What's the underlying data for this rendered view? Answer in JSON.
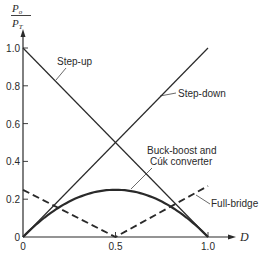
{
  "chart_data": {
    "type": "line",
    "title": "",
    "xlabel": "D",
    "ylabel": "Po/PT",
    "ylabel_parts": {
      "num": "P",
      "num_sub": "o",
      "den": "P",
      "den_sub": "T"
    },
    "xlim": [
      0,
      1.0
    ],
    "ylim": [
      0,
      1.0
    ],
    "grid": false,
    "x_ticks": [
      {
        "value": 0,
        "label": "0"
      },
      {
        "value": 0.5,
        "label": "0.5"
      },
      {
        "value": 1.0,
        "label": "1.0"
      }
    ],
    "y_ticks": [
      {
        "value": 0,
        "label": "0"
      },
      {
        "value": 0.2,
        "label": "0.2"
      },
      {
        "value": 0.4,
        "label": "0.4"
      },
      {
        "value": 0.6,
        "label": "0.6"
      },
      {
        "value": 0.8,
        "label": "0.8"
      },
      {
        "value": 1.0,
        "label": "1.0"
      }
    ],
    "series": [
      {
        "name": "Step-up",
        "style": "solid-thin",
        "x": [
          0,
          1.0
        ],
        "y": [
          1.0,
          0
        ]
      },
      {
        "name": "Step-down",
        "style": "solid-thin",
        "x": [
          0,
          1.0
        ],
        "y": [
          0,
          1.0
        ]
      },
      {
        "name": "Buck-boost and Cúk converter",
        "style": "solid-thick",
        "x": [
          0,
          0.1,
          0.2,
          0.3,
          0.4,
          0.5,
          0.6,
          0.7,
          0.8,
          0.9,
          1.0
        ],
        "y": [
          0,
          0.09,
          0.16,
          0.21,
          0.24,
          0.25,
          0.24,
          0.21,
          0.16,
          0.09,
          0
        ]
      },
      {
        "name": "Full-bridge",
        "style": "dashed",
        "x": [
          0,
          0.5,
          1.0
        ],
        "y": [
          0.25,
          0,
          0.27
        ]
      }
    ],
    "annotations": [
      {
        "text": "Step-up",
        "series": "Step-up"
      },
      {
        "text": "Step-down",
        "series": "Step-down"
      },
      {
        "text": "Buck-boost and",
        "series": "Buck-boost and Cúk converter"
      },
      {
        "text": "Cúk converter",
        "series": "Buck-boost and Cúk converter"
      },
      {
        "text": "Full-bridge",
        "series": "Full-bridge"
      }
    ],
    "legend": null
  },
  "colors": {
    "ink": "#2a2a2a",
    "background": "#ffffff"
  }
}
